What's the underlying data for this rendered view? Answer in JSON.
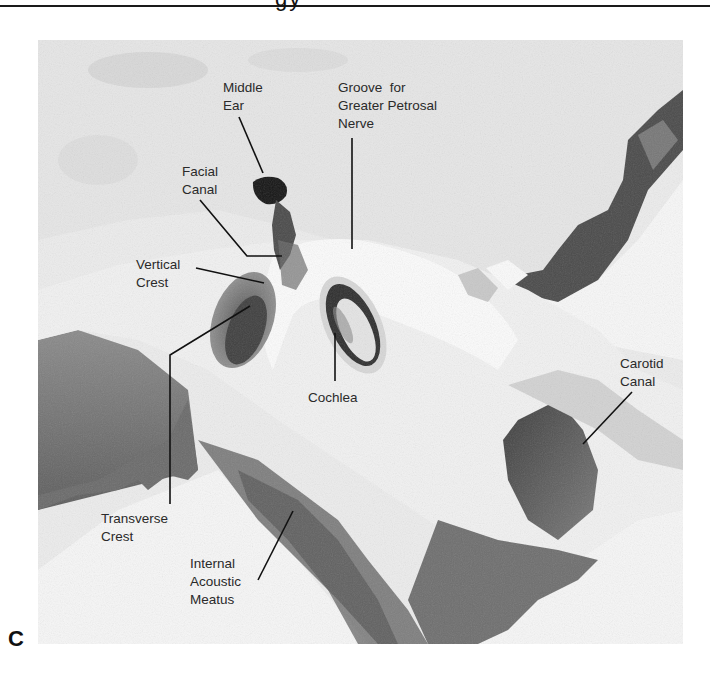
{
  "header": {
    "title_fragment": "gy"
  },
  "figure": {
    "panel_label": "C",
    "image_description": "Photograph of temporal bone (petrous part) viewed from above, showing internal acoustic meatus region",
    "labels": [
      {
        "id": "middle-ear",
        "lines": [
          "Middle",
          "Ear"
        ],
        "text": "Middle\nEar"
      },
      {
        "id": "groove-greater-petrosal-nerve",
        "text": "Groove  for\nGreater Petrosal\nNerve"
      },
      {
        "id": "facial-canal",
        "text": "Facial\nCanal"
      },
      {
        "id": "vertical-crest",
        "text": "Vertical\nCrest"
      },
      {
        "id": "cochlea",
        "text": "Cochlea"
      },
      {
        "id": "carotid-canal",
        "text": "Carotid\nCanal"
      },
      {
        "id": "transverse-crest",
        "text": "Transverse\nCrest"
      },
      {
        "id": "internal-acoustic-meatus",
        "text": "Internal\nAcoustic\nMeatus"
      }
    ]
  },
  "colors": {
    "background": "#ffffff",
    "bone_light": "#f2f2f2",
    "bone_mid": "#bdbdbd",
    "bone_dark": "#3a3a3a",
    "label_text": "#2a2a2a",
    "leader_line": "#111111"
  }
}
